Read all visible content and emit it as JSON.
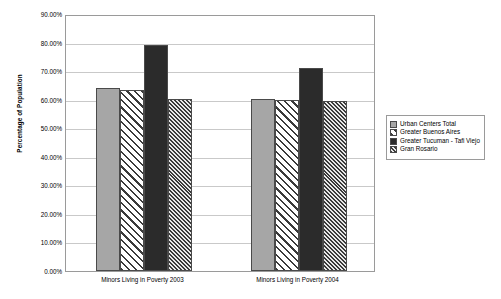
{
  "chart_data": {
    "type": "bar",
    "title": "",
    "xlabel": "",
    "ylabel": "Percentage of Population",
    "ylim": [
      0,
      90
    ],
    "ytick_step": 10,
    "ytick_labels": [
      "0.00%",
      "10.00%",
      "20.00%",
      "30.00%",
      "40.00%",
      "50.00%",
      "60.00%",
      "70.00%",
      "80.00%",
      "90.00%"
    ],
    "ytick_values": [
      0,
      10,
      20,
      30,
      40,
      50,
      60,
      70,
      80,
      90
    ],
    "grid": true,
    "legend_position": "right",
    "categories": [
      "Minors Living in Poverty 2003",
      "Minors Living in Poverty 2004"
    ],
    "series": [
      {
        "name": "Urban Centers Total",
        "pattern": "solid-light",
        "color": "#a6a6a6",
        "values": [
          64.0,
          60.3
        ]
      },
      {
        "name": "Greater Buenos Aires",
        "pattern": "diagonal-hatch",
        "color": "#ffffff",
        "values": [
          63.5,
          60.0
        ]
      },
      {
        "name": "Greater Tucuman - Tafi Viejo",
        "pattern": "solid-dark",
        "color": "#2b2b2b",
        "values": [
          79.0,
          71.0
        ]
      },
      {
        "name": "Gran Rosario",
        "pattern": "checker-hatch",
        "color": "#787878",
        "values": [
          60.3,
          59.5
        ]
      }
    ]
  },
  "legend": {
    "items": [
      {
        "label": "Urban Centers Total"
      },
      {
        "label": "Greater Buenos Aires"
      },
      {
        "label": "Greater Tucuman - Tafi Viejo"
      },
      {
        "label": "Gran Rosario"
      }
    ]
  }
}
